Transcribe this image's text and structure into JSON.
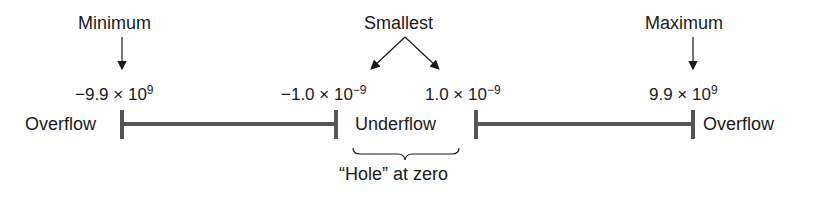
{
  "diagram": {
    "title_labels": {
      "minimum": "Minimum",
      "smallest": "Smallest",
      "maximum": "Maximum"
    },
    "values": {
      "min": {
        "mantissa": "−9.9 × 10",
        "exp": "9"
      },
      "neg_small": {
        "mantissa": "−1.0 × 10",
        "exp": "−9"
      },
      "pos_small": {
        "mantissa": "1.0 × 10",
        "exp": "−9"
      },
      "max": {
        "mantissa": "9.9 × 10",
        "exp": "9"
      }
    },
    "regions": {
      "left_overflow": "Overflow",
      "underflow": "Underflow",
      "right_overflow": "Overflow"
    },
    "brace_label": "“Hole” at zero",
    "colors": {
      "bar": "#555555",
      "text": "#1a1a1a",
      "arrow": "#1a1a1a"
    }
  }
}
